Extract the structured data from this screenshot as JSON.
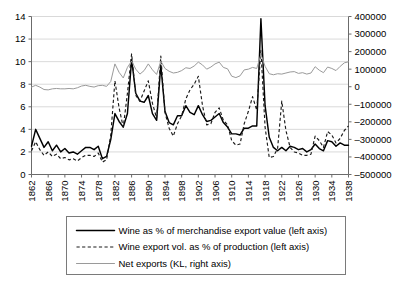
{
  "chart_data": {
    "type": "line",
    "title": "",
    "xlabel": "",
    "ylabel": "",
    "grid": true,
    "legend_position": "bottom",
    "x": [
      1862,
      1863,
      1864,
      1865,
      1866,
      1867,
      1868,
      1869,
      1870,
      1871,
      1872,
      1873,
      1874,
      1875,
      1876,
      1877,
      1878,
      1879,
      1880,
      1881,
      1882,
      1883,
      1884,
      1885,
      1886,
      1887,
      1888,
      1889,
      1890,
      1891,
      1892,
      1893,
      1894,
      1895,
      1896,
      1897,
      1898,
      1899,
      1900,
      1901,
      1902,
      1903,
      1904,
      1905,
      1906,
      1907,
      1908,
      1909,
      1910,
      1911,
      1912,
      1913,
      1914,
      1915,
      1916,
      1917,
      1918,
      1919,
      1920,
      1921,
      1922,
      1923,
      1924,
      1925,
      1926,
      1927,
      1928,
      1929,
      1930,
      1931,
      1932,
      1933,
      1934,
      1935,
      1936,
      1937,
      1938
    ],
    "xtick_labels": [
      "1862",
      "1866",
      "1870",
      "1874",
      "1878",
      "1882",
      "1886",
      "1890",
      "1894",
      "1898",
      "1902",
      "1906",
      "1910",
      "1914",
      "1918",
      "1922",
      "1926",
      "1930",
      "1934",
      "1938"
    ],
    "xtick_values": [
      1862,
      1866,
      1870,
      1874,
      1878,
      1882,
      1886,
      1890,
      1894,
      1898,
      1902,
      1906,
      1910,
      1914,
      1918,
      1922,
      1926,
      1930,
      1934,
      1938
    ],
    "left_axis": {
      "min": 0,
      "max": 14,
      "tick_step": 2,
      "tick_labels": [
        "0",
        "2",
        "4",
        "6",
        "8",
        "10",
        "12",
        "14"
      ],
      "tick_values": [
        0,
        2,
        4,
        6,
        8,
        10,
        12,
        14
      ]
    },
    "right_axis": {
      "min": -500000,
      "max": 400000,
      "tick_step": 100000,
      "tick_labels": [
        "-500000",
        "-400000",
        "-300000",
        "-200000",
        "-100000",
        "0",
        "100000",
        "200000",
        "300000",
        "400000"
      ],
      "tick_values": [
        -500000,
        -400000,
        -300000,
        -200000,
        -100000,
        0,
        100000,
        200000,
        300000,
        400000
      ]
    },
    "series": [
      {
        "name": "Wine as % of merchandise export value (left axis)",
        "axis": "left",
        "style": "solid",
        "color": "#000000",
        "values": [
          2.5,
          4.0,
          3.2,
          2.4,
          2.9,
          2.1,
          2.6,
          2.0,
          2.3,
          1.9,
          2.0,
          1.8,
          2.1,
          2.4,
          2.4,
          2.2,
          2.5,
          1.4,
          1.6,
          3.1,
          5.4,
          4.7,
          4.2,
          5.4,
          10.2,
          7.2,
          6.5,
          6.4,
          7.0,
          5.4,
          4.8,
          9.7,
          5.6,
          4.6,
          4.4,
          5.2,
          5.2,
          6.1,
          5.5,
          5.3,
          6.1,
          5.3,
          4.7,
          4.8,
          5.1,
          5.4,
          4.6,
          4.2,
          3.6,
          3.6,
          3.5,
          4.1,
          4.1,
          4.3,
          4.3,
          13.8,
          6.1,
          3.3,
          2.4,
          2.1,
          2.4,
          2.1,
          2.5,
          2.4,
          2.2,
          2.3,
          2.0,
          2.2,
          2.7,
          2.3,
          2.1,
          3.0,
          2.9,
          2.5,
          2.8,
          2.6,
          2.6
        ]
      },
      {
        "name": "Wine export vol. as % of production (left axis)",
        "axis": "left",
        "style": "dashed",
        "color": "#1a1a1a",
        "values": [
          2.1,
          2.9,
          2.2,
          1.7,
          2.0,
          1.6,
          1.8,
          1.4,
          1.5,
          1.3,
          1.4,
          1.2,
          1.5,
          1.7,
          1.7,
          1.6,
          1.9,
          1.1,
          1.3,
          3.5,
          8.3,
          5.9,
          4.2,
          7.2,
          10.7,
          7.0,
          6.5,
          7.4,
          8.3,
          6.3,
          5.0,
          10.5,
          5.5,
          4.1,
          3.4,
          4.5,
          5.2,
          6.7,
          7.5,
          8.0,
          8.7,
          6.1,
          4.4,
          4.5,
          5.5,
          5.9,
          4.8,
          4.4,
          3.0,
          2.6,
          2.7,
          4.5,
          5.6,
          6.9,
          5.7,
          11.0,
          4.2,
          1.5,
          1.6,
          2.3,
          6.5,
          3.9,
          2.4,
          2.0,
          1.9,
          1.7,
          1.7,
          1.8,
          3.4,
          3.0,
          2.4,
          3.8,
          3.5,
          2.8,
          3.2,
          3.9,
          4.3
        ]
      },
      {
        "name": "Net exports (KL, right axis)",
        "axis": "right",
        "style": "solid-grey",
        "color": "#9a9a9a",
        "values": [
          -2000,
          8000,
          -2000,
          -16000,
          -18000,
          -12000,
          -10000,
          -12000,
          -12000,
          -10000,
          -12000,
          -6000,
          4000,
          8000,
          2000,
          -2000,
          6000,
          8000,
          2000,
          30000,
          130000,
          82000,
          50000,
          110000,
          146000,
          100000,
          72000,
          92000,
          130000,
          96000,
          70000,
          146000,
          104000,
          88000,
          78000,
          82000,
          92000,
          108000,
          104000,
          118000,
          140000,
          124000,
          100000,
          112000,
          130000,
          140000,
          110000,
          102000,
          60000,
          52000,
          62000,
          96000,
          100000,
          110000,
          104000,
          184000,
          116000,
          74000,
          68000,
          74000,
          72000,
          78000,
          84000,
          86000,
          76000,
          80000,
          72000,
          78000,
          114000,
          94000,
          80000,
          112000,
          104000,
          92000,
          116000,
          136000,
          142000
        ]
      }
    ]
  },
  "legend": {
    "items": [
      {
        "label": "Wine as % of merchandise export value (left axis)",
        "style": "solid-black"
      },
      {
        "label": "Wine export vol. as % of production (left axis)",
        "style": "dashed-black"
      },
      {
        "label": "Net exports (KL, right axis)",
        "style": "solid-grey"
      }
    ]
  }
}
